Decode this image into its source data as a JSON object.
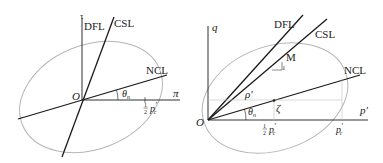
{
  "left_panel": {
    "axis_vertical": "τ",
    "axis_horizontal": "π",
    "origin": "O",
    "lines": {
      "dfl": "DFL",
      "csl": "CSL",
      "ncl": "NCL"
    },
    "angle": "θ",
    "angle_sub": "n",
    "tick": {
      "frac_num": "1",
      "frac_den": "2",
      "symbol": "p",
      "prime": "′",
      "sub": "c"
    }
  },
  "right_panel": {
    "axis_vertical": "q",
    "axis_horizontal": "p′",
    "origin": "O",
    "lines": {
      "dfl": "DFL",
      "csl": "CSL",
      "ncl": "NCL"
    },
    "slope_label": "M",
    "slope_unit": "1",
    "radius": "ρ′",
    "zeta": "ζ",
    "angle": "θ",
    "angle_sub": "n",
    "tick_half": {
      "frac_num": "1",
      "frac_den": "2",
      "symbol": "p",
      "prime": "′",
      "sub": "c"
    },
    "tick_full": {
      "symbol": "p",
      "prime": "′",
      "sub": "c"
    }
  },
  "colors": {
    "line": "#1a1a1a",
    "ellipse": "#b5b5b5",
    "guide": "#c0c0c0"
  }
}
